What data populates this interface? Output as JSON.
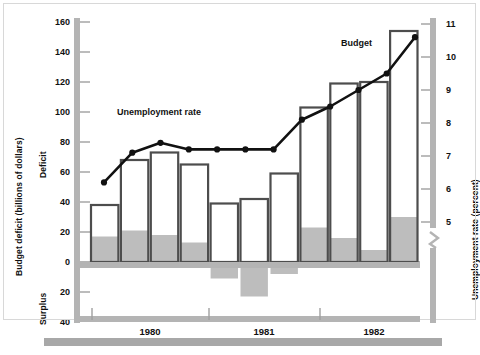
{
  "chart_data": {
    "type": "bar",
    "title": "",
    "subtitle": "",
    "xlabel": "",
    "ylabel": "Budget deficit (billions of dollars)",
    "y2label": "Unemployment rate (percent)",
    "left_axis": {
      "label": "Budget deficit (billions of dollars)",
      "upper_region_label": "Deficit",
      "lower_region_label": "Surplus",
      "ticks": [
        160,
        140,
        120,
        100,
        80,
        60,
        40,
        20,
        0,
        20,
        40
      ],
      "tick_values_signed": [
        160,
        140,
        120,
        100,
        80,
        60,
        40,
        20,
        0,
        -20,
        -40
      ],
      "ylim": [
        -40,
        160
      ],
      "unit": "billions of dollars"
    },
    "right_axis": {
      "label": "Unemployment rate (percent)",
      "ticks": [
        11,
        10,
        9,
        8,
        7,
        6,
        5
      ],
      "ylim": [
        5,
        11
      ],
      "unit": "percent",
      "has_axis_break": true,
      "break_note": "axis break below 5"
    },
    "x_axis": {
      "tick_labels": [
        "1980",
        "1981",
        "1982"
      ],
      "grid": false
    },
    "series": [
      {
        "name": "Budget",
        "type": "bar",
        "label": "Budget",
        "unit": "billions of dollars",
        "categories": [
          "Q1-1980",
          "Q2-1980",
          "Q3-1980",
          "Q4-1980",
          "Q1-1981",
          "Q2-1981",
          "Q3-1981",
          "Q4-1981",
          "Q1-1982",
          "Q2-1982",
          "Q3-1982"
        ],
        "values": [
          38,
          68,
          73,
          65,
          39,
          42,
          59,
          103,
          119,
          120,
          154
        ],
        "shaded_portion_values": [
          17,
          21,
          18,
          13,
          -11,
          -23,
          -8,
          23,
          16,
          8,
          30
        ],
        "negative_bars_indices": [
          4,
          5,
          6
        ]
      },
      {
        "name": "Unemployment rate",
        "type": "line",
        "label": "Unemployment rate",
        "unit": "percent",
        "values": [
          6.2,
          7.1,
          7.4,
          7.2,
          7.2,
          7.2,
          7.2,
          8.1,
          8.5,
          9.0,
          9.5,
          10.6
        ]
      }
    ],
    "legend": {
      "position": "inline-annotations",
      "entries": [
        "Unemployment rate",
        "Budget"
      ]
    },
    "colors": {
      "bar_outline": "#4d4d4d",
      "bar_fill": "#ffffff",
      "bar_shade": "#bdbdbd",
      "line": "#111111",
      "axis": "#a8a8a8",
      "text": "#111111",
      "background": "#ffffff"
    }
  },
  "annotations": {
    "unemployment_label": "Unemployment rate",
    "budget_label": "Budget"
  }
}
